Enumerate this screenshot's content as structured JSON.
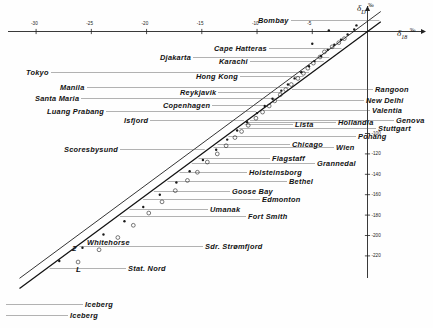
{
  "figure": {
    "background": "#fefefe",
    "ink": "#1a1a1a"
  },
  "axes": {
    "x_title_delta": "δ",
    "x_title_sub": "18",
    "x_title_unit": "‰",
    "y_title_delta": "δ",
    "y_title_sub": "D",
    "y_title_unit": "‰",
    "x_ticks": [
      "-30",
      "-25",
      "-20",
      "-15",
      "-10",
      "-5"
    ],
    "y_ticks": [
      "-100",
      "-120",
      "-140",
      "-160",
      "-180",
      "-200",
      "-220"
    ]
  },
  "lines": {
    "upper_label": "2",
    "lower_label": "L"
  },
  "labels": [
    {
      "text": "Bombay",
      "x": 258,
      "y": 16
    },
    {
      "text": "Cape  Hatteras",
      "x": 214,
      "y": 44
    },
    {
      "text": "Djakarta",
      "x": 160,
      "y": 53
    },
    {
      "text": "Karachi",
      "x": 219,
      "y": 57
    },
    {
      "text": "Tokyo",
      "x": 26,
      "y": 68
    },
    {
      "text": "Hong  Kong",
      "x": 196,
      "y": 72
    },
    {
      "text": "Manila",
      "x": 60,
      "y": 83
    },
    {
      "text": "Reykjavik",
      "x": 180,
      "y": 88
    },
    {
      "text": "Santa  Maria",
      "x": 35,
      "y": 94
    },
    {
      "text": "Copenhagen",
      "x": 163,
      "y": 101
    },
    {
      "text": "Luang  Prabang",
      "x": 47,
      "y": 107
    },
    {
      "text": "Isfjord",
      "x": 124,
      "y": 116
    },
    {
      "text": "Scoresbysund",
      "x": 64,
      "y": 145
    },
    {
      "text": "Rangoon",
      "x": 375,
      "y": 85
    },
    {
      "text": "New  Delhi",
      "x": 366,
      "y": 96
    },
    {
      "text": "Valentia",
      "x": 372,
      "y": 106
    },
    {
      "text": "Genova",
      "x": 396,
      "y": 116
    },
    {
      "text": "Hollandia",
      "x": 338,
      "y": 118
    },
    {
      "text": "Stuttgart",
      "x": 378,
      "y": 124
    },
    {
      "text": "Lista",
      "x": 295,
      "y": 120
    },
    {
      "text": "Pohang",
      "x": 358,
      "y": 132
    },
    {
      "text": "Chicago",
      "x": 292,
      "y": 140
    },
    {
      "text": "Wien",
      "x": 336,
      "y": 143
    },
    {
      "text": "Flagstaff",
      "x": 272,
      "y": 154
    },
    {
      "text": "Grannedal",
      "x": 317,
      "y": 159
    },
    {
      "text": "Holsteinsborg",
      "x": 249,
      "y": 168
    },
    {
      "text": "Bethel",
      "x": 289,
      "y": 177
    },
    {
      "text": "Goose  Bay",
      "x": 232,
      "y": 187
    },
    {
      "text": "Edmonton",
      "x": 262,
      "y": 195
    },
    {
      "text": "Umanak",
      "x": 210,
      "y": 205
    },
    {
      "text": "Fort  Smith",
      "x": 248,
      "y": 212
    },
    {
      "text": "Whitehorse",
      "x": 87,
      "y": 238
    },
    {
      "text": "Sdr.  Strømfjord",
      "x": 205,
      "y": 242
    },
    {
      "text": "Stat.  Nord",
      "x": 128,
      "y": 264
    },
    {
      "text": "Iceberg",
      "x": 85,
      "y": 300
    },
    {
      "text": "Iceberg",
      "x": 70,
      "y": 311
    }
  ],
  "chart_data": {
    "type": "scatter",
    "title": "",
    "xlabel": "δ18 ‰",
    "ylabel": "δD ‰",
    "xlim": [
      -32,
      3
    ],
    "ylim": [
      -235,
      15
    ],
    "grid": false,
    "legend": "none",
    "fit_lines": [
      {
        "name": "2",
        "style": "upper parallel meteoric line",
        "slope": 8,
        "intercept": 10
      },
      {
        "name": "L",
        "style": "lower parallel meteoric line",
        "slope": 8,
        "intercept": 0
      }
    ],
    "series": [
      {
        "name": "open circles (precipitation stations)",
        "marker": "open-circle",
        "points": [
          [
            -2.1,
            -7
          ],
          [
            -2.6,
            -11
          ],
          [
            -3.2,
            -15
          ],
          [
            -3.9,
            -20
          ],
          [
            -4.3,
            -25
          ],
          [
            -4.9,
            -31
          ],
          [
            -5.4,
            -36
          ],
          [
            -5.8,
            -41
          ],
          [
            -6.3,
            -46
          ],
          [
            -6.9,
            -52
          ],
          [
            -7.4,
            -57
          ],
          [
            -7.9,
            -62
          ],
          [
            -8.4,
            -68
          ],
          [
            -8.9,
            -73
          ],
          [
            -9.5,
            -79
          ],
          [
            -10.1,
            -85
          ],
          [
            -10.8,
            -92
          ],
          [
            -11.4,
            -98
          ],
          [
            -12.0,
            -104
          ],
          [
            -12.8,
            -112
          ],
          [
            -13.6,
            -120
          ],
          [
            -14.5,
            -128
          ],
          [
            -15.4,
            -138
          ],
          [
            -16.3,
            -146
          ],
          [
            -17.4,
            -156
          ],
          [
            -18.6,
            -167
          ],
          [
            -19.8,
            -178
          ],
          [
            -21.2,
            -190
          ],
          [
            -22.6,
            -202
          ],
          [
            -24.3,
            -214
          ],
          [
            -26.2,
            -226
          ]
        ]
      },
      {
        "name": "filled dots (precipitation stations)",
        "marker": "filled-dot",
        "points": [
          [
            -1.2,
            2
          ],
          [
            -1.8,
            -3
          ],
          [
            -2.4,
            -8
          ],
          [
            -3.0,
            -13
          ],
          [
            -3.6,
            -18
          ],
          [
            -4.2,
            -24
          ],
          [
            -4.8,
            -29
          ],
          [
            -5.3,
            -34
          ],
          [
            -6.0,
            -40
          ],
          [
            -6.6,
            -46
          ],
          [
            -7.2,
            -52
          ],
          [
            -7.8,
            -58
          ],
          [
            -8.6,
            -66
          ],
          [
            -9.3,
            -73
          ],
          [
            -10.0,
            -80
          ],
          [
            -10.9,
            -89
          ],
          [
            -11.8,
            -97
          ],
          [
            -12.7,
            -106
          ],
          [
            -13.7,
            -116
          ],
          [
            -14.9,
            -126
          ],
          [
            -16.1,
            -137
          ],
          [
            -17.3,
            -148
          ],
          [
            -18.8,
            -160
          ],
          [
            -20.3,
            -172
          ],
          [
            -22.0,
            -186
          ],
          [
            -23.9,
            -199
          ],
          [
            -25.8,
            -212
          ],
          [
            -27.9,
            -225
          ]
        ]
      },
      {
        "name": "Bombay / Cape Hatteras outliers",
        "marker": "filled-dot",
        "points": [
          [
            -1.0,
            6
          ],
          [
            -3.5,
            1
          ],
          [
            -5.0,
            -12
          ]
        ]
      }
    ]
  }
}
